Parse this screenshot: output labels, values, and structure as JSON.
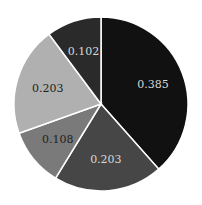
{
  "chart_data": {
    "type": "pie",
    "title": "",
    "start": "top",
    "direction": "clockwise",
    "slices": [
      {
        "label": "0.385",
        "value": 0.385,
        "color": "#111111",
        "text_color": "#d8d8d8"
      },
      {
        "label": "0.203",
        "value": 0.203,
        "color": "#464646",
        "text_color": "#d8d8d8"
      },
      {
        "label": "0.108",
        "value": 0.108,
        "color": "#7a7a7a",
        "text_color": "#222222"
      },
      {
        "label": "0.203",
        "value": 0.203,
        "color": "#b0b0b0",
        "text_color": "#222222"
      },
      {
        "label": "0.102",
        "value": 0.102,
        "color": "#2a2a2a",
        "text_color": "#d8d8d8"
      }
    ],
    "edge_color": "#ffffff"
  }
}
